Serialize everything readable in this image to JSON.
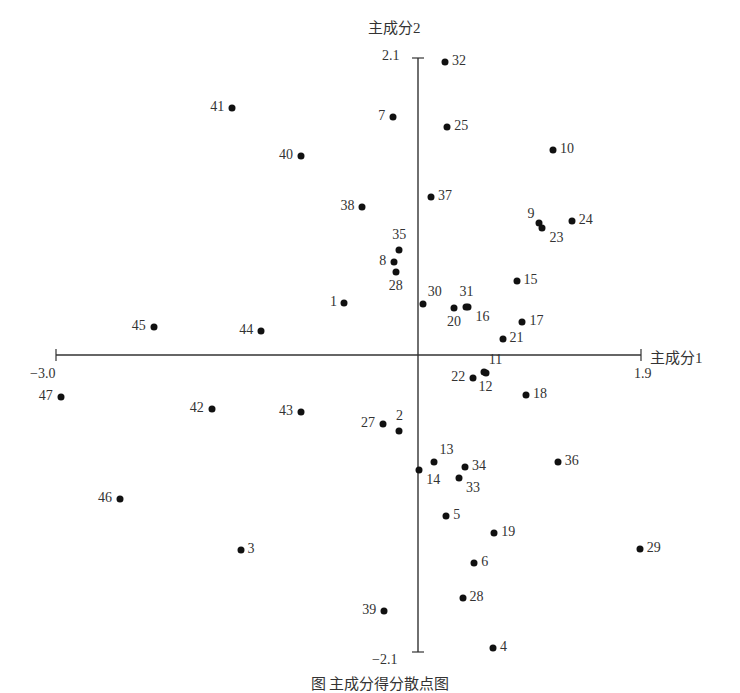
{
  "chart_data": {
    "type": "scatter",
    "title": "",
    "xlabel": "主成分1",
    "ylabel": "主成分2",
    "xlim": [
      -3.0,
      1.9
    ],
    "ylim": [
      -2.1,
      2.1
    ],
    "x_tick_labels": {
      "min": "−3.0",
      "max": "1.9"
    },
    "y_tick_labels": {
      "min": "−2.1",
      "max": "2.1"
    },
    "grid": false,
    "legend": "none",
    "points": [
      {
        "label": "32",
        "x": 0.23,
        "y": 2.07,
        "lp": "r"
      },
      {
        "label": "41",
        "x": -1.54,
        "y": 1.75,
        "lp": "l"
      },
      {
        "label": "7",
        "x": -0.21,
        "y": 1.68,
        "lp": "l"
      },
      {
        "label": "25",
        "x": 0.25,
        "y": 1.61,
        "lp": "r"
      },
      {
        "label": "10",
        "x": 1.15,
        "y": 1.45,
        "lp": "r"
      },
      {
        "label": "40",
        "x": -0.97,
        "y": 1.41,
        "lp": "l"
      },
      {
        "label": "38",
        "x": -0.46,
        "y": 1.05,
        "lp": "l"
      },
      {
        "label": "37",
        "x": 0.11,
        "y": 1.12,
        "lp": "r"
      },
      {
        "label": "9",
        "x": 1.03,
        "y": 0.93,
        "lp": "tl"
      },
      {
        "label": "23",
        "x": 1.06,
        "y": 0.9,
        "lp": "br"
      },
      {
        "label": "24",
        "x": 1.31,
        "y": 0.95,
        "lp": "r"
      },
      {
        "label": "35",
        "x": -0.16,
        "y": 0.74,
        "lp": "t"
      },
      {
        "label": "8",
        "x": -0.2,
        "y": 0.66,
        "lp": "l"
      },
      {
        "label": "28",
        "x": -0.18,
        "y": 0.59,
        "lp": "b"
      },
      {
        "label": "15",
        "x": 0.84,
        "y": 0.52,
        "lp": "r"
      },
      {
        "label": "1",
        "x": -0.61,
        "y": 0.37,
        "lp": "l"
      },
      {
        "label": "30",
        "x": 0.04,
        "y": 0.36,
        "lp": "tr"
      },
      {
        "label": "20",
        "x": 0.31,
        "y": 0.33,
        "lp": "b"
      },
      {
        "label": "31",
        "x": 0.41,
        "y": 0.34,
        "lp": "t"
      },
      {
        "label": "16",
        "x": 0.43,
        "y": 0.34,
        "lp": "br"
      },
      {
        "label": "17",
        "x": 0.89,
        "y": 0.23,
        "lp": "r"
      },
      {
        "label": "45",
        "x": -2.19,
        "y": 0.2,
        "lp": "l"
      },
      {
        "label": "44",
        "x": -1.3,
        "y": 0.17,
        "lp": "l"
      },
      {
        "label": "21",
        "x": 0.72,
        "y": 0.11,
        "lp": "r"
      },
      {
        "label": "22",
        "x": 0.47,
        "y": -0.16,
        "lp": "l"
      },
      {
        "label": "11",
        "x": 0.56,
        "y": -0.12,
        "lp": "tr"
      },
      {
        "label": "12",
        "x": 0.58,
        "y": -0.13,
        "lp": "b"
      },
      {
        "label": "18",
        "x": 0.92,
        "y": -0.28,
        "lp": "r"
      },
      {
        "label": "47",
        "x": -2.96,
        "y": -0.3,
        "lp": "l"
      },
      {
        "label": "42",
        "x": -1.71,
        "y": -0.38,
        "lp": "l"
      },
      {
        "label": "43",
        "x": -0.97,
        "y": -0.4,
        "lp": "l"
      },
      {
        "label": "27",
        "x": -0.29,
        "y": -0.49,
        "lp": "l"
      },
      {
        "label": "2",
        "x": -0.16,
        "y": -0.54,
        "lp": "t"
      },
      {
        "label": "13",
        "x": 0.14,
        "y": -0.76,
        "lp": "tr"
      },
      {
        "label": "14",
        "x": 0.01,
        "y": -0.81,
        "lp": "br"
      },
      {
        "label": "34",
        "x": 0.4,
        "y": -0.79,
        "lp": "r"
      },
      {
        "label": "33",
        "x": 0.35,
        "y": -0.87,
        "lp": "br"
      },
      {
        "label": "36",
        "x": 1.19,
        "y": -0.76,
        "lp": "r"
      },
      {
        "label": "46",
        "x": -2.47,
        "y": -1.02,
        "lp": "l"
      },
      {
        "label": "5",
        "x": 0.24,
        "y": -1.14,
        "lp": "r"
      },
      {
        "label": "19",
        "x": 0.65,
        "y": -1.26,
        "lp": "r"
      },
      {
        "label": "29",
        "x": 1.89,
        "y": -1.37,
        "lp": "r"
      },
      {
        "label": "3",
        "x": -1.47,
        "y": -1.38,
        "lp": "r"
      },
      {
        "label": "6",
        "x": 0.48,
        "y": -1.47,
        "lp": "r"
      },
      {
        "label": "28",
        "x": 0.38,
        "y": -1.72,
        "lp": "r"
      },
      {
        "label": "39",
        "x": -0.28,
        "y": -1.81,
        "lp": "l"
      },
      {
        "label": "4",
        "x": 0.64,
        "y": -2.07,
        "lp": "r"
      }
    ]
  },
  "caption": "图 主成分得分散点图"
}
